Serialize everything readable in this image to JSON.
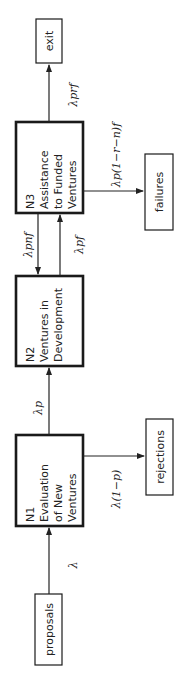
{
  "diagram": {
    "nodes": {
      "proposals": {
        "label": "proposals"
      },
      "n1": {
        "lines": [
          "N1",
          "Evaluation",
          "of New",
          "Ventures"
        ]
      },
      "n2": {
        "lines": [
          "N2",
          "Ventures in",
          "Development"
        ]
      },
      "n3": {
        "lines": [
          "N3",
          "Assistance",
          "to Funded",
          "Ventures"
        ]
      },
      "rejections": {
        "label": "rejections"
      },
      "failures": {
        "label": "failures"
      },
      "exit": {
        "label": "exit"
      }
    },
    "edges": {
      "proposals_to_n1": {
        "label": "λ"
      },
      "n1_to_rejections": {
        "label": "λ(1−p)"
      },
      "n1_to_n2": {
        "label": "λp"
      },
      "n3_to_n2": {
        "label": "λpnf"
      },
      "n2_to_n3": {
        "label": "λpf"
      },
      "n3_to_failures": {
        "label": "λp(1−r−n)f"
      },
      "n3_to_exit": {
        "label": "λprf"
      }
    }
  }
}
